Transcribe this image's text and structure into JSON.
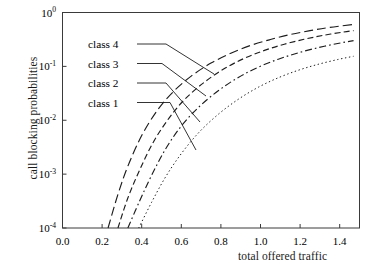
{
  "chart_data": {
    "type": "line",
    "title": "",
    "xlabel": "total offered traffic",
    "ylabel": "call blocking probabilities",
    "xlim": [
      0.0,
      1.5
    ],
    "ylim": [
      0.0001,
      1.0
    ],
    "yscale": "log",
    "xscale": "linear",
    "grid": false,
    "legend_position": "inside-upper-left",
    "xticks": [
      "0.0",
      "0.2",
      "0.4",
      "0.6",
      "0.8",
      "1.0",
      "1.2",
      "1.4"
    ],
    "xtick_values": [
      0.0,
      0.2,
      0.4,
      0.6,
      0.8,
      1.0,
      1.2,
      1.4
    ],
    "yticks": [
      "10^0",
      "10^-1",
      "10^-2",
      "10^-3",
      "10^-4"
    ],
    "ytick_values": [
      1,
      0.1,
      0.01,
      0.001,
      0.0001
    ],
    "ytick_mantissa": "10",
    "ytick_exponents": [
      "0",
      "-1",
      "-2",
      "-3",
      "-4"
    ],
    "series": [
      {
        "name": "class 4",
        "dash": "9,4",
        "x": [
          0.23,
          0.28,
          0.33,
          0.4,
          0.48,
          0.56,
          0.65,
          0.75,
          0.85,
          0.95,
          1.05,
          1.15,
          1.25,
          1.35,
          1.47
        ],
        "y": [
          0.0001,
          0.00042,
          0.0014,
          0.0052,
          0.0155,
          0.034,
          0.066,
          0.115,
          0.175,
          0.245,
          0.315,
          0.39,
          0.46,
          0.53,
          0.6
        ]
      },
      {
        "name": "class 3",
        "dash": "6,3.2",
        "x": [
          0.28,
          0.33,
          0.39,
          0.46,
          0.54,
          0.62,
          0.72,
          0.82,
          0.92,
          1.02,
          1.12,
          1.22,
          1.32,
          1.42,
          1.47
        ],
        "y": [
          0.0001,
          0.00036,
          0.0012,
          0.004,
          0.0112,
          0.025,
          0.052,
          0.092,
          0.142,
          0.198,
          0.258,
          0.318,
          0.378,
          0.435,
          0.462
        ]
      },
      {
        "name": "class 2",
        "dash": "7,3,1.6,3",
        "x": [
          0.33,
          0.39,
          0.45,
          0.52,
          0.6,
          0.69,
          0.79,
          0.89,
          0.99,
          1.09,
          1.19,
          1.29,
          1.39,
          1.47
        ],
        "y": [
          0.0001,
          0.00032,
          0.00095,
          0.0029,
          0.0078,
          0.0178,
          0.036,
          0.063,
          0.097,
          0.136,
          0.178,
          0.222,
          0.266,
          0.3
        ]
      },
      {
        "name": "class 1",
        "dash": "1.4,2.6",
        "x": [
          0.385,
          0.45,
          0.52,
          0.6,
          0.69,
          0.79,
          0.89,
          0.99,
          1.09,
          1.19,
          1.29,
          1.39,
          1.47
        ],
        "y": [
          0.0001,
          0.0003,
          0.00088,
          0.0024,
          0.006,
          0.0132,
          0.0248,
          0.0412,
          0.0615,
          0.0845,
          0.109,
          0.134,
          0.154
        ]
      }
    ]
  },
  "legend": {
    "items": [
      {
        "label": "class 4"
      },
      {
        "label": "class 3"
      },
      {
        "label": "class 2"
      },
      {
        "label": "class 1"
      }
    ]
  },
  "colors": {
    "ink": "#1d1d1d",
    "axis": "#3a3a3a",
    "background": "#ffffff"
  }
}
